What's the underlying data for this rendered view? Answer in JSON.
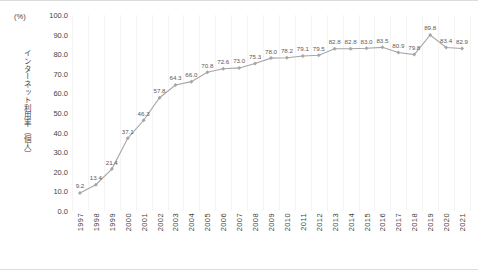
{
  "chart_data": {
    "type": "line",
    "title": "",
    "subtitle": "",
    "unit_label": "(%)",
    "xlabel": "",
    "ylabel": "インターネット利用率（個人）",
    "ylim": [
      0.0,
      100.0
    ],
    "ytick_labels": [
      "100.0",
      "90.0",
      "80.0",
      "70.0",
      "60.0",
      "50.0",
      "40.0",
      "30.0",
      "20.0",
      "10.0",
      "0.0"
    ],
    "ytick_values": [
      100.0,
      90.0,
      80.0,
      70.0,
      60.0,
      50.0,
      40.0,
      30.0,
      20.0,
      10.0,
      0.0
    ],
    "grid": "vertical-only",
    "legend": "none",
    "series_color": "#a6a6a6",
    "marker": "diamond",
    "categories": [
      "1997",
      "1998",
      "1999",
      "2000",
      "2001",
      "2002",
      "2003",
      "2004",
      "2005",
      "2006",
      "2007",
      "2008",
      "2009",
      "2010",
      "2011",
      "2012",
      "2013",
      "2014",
      "2015",
      "2016",
      "2017",
      "2018",
      "2019",
      "2020",
      "2021"
    ],
    "values": [
      9.2,
      13.4,
      21.4,
      37.1,
      46.3,
      57.8,
      64.3,
      66.0,
      70.8,
      72.6,
      73.0,
      75.3,
      78.0,
      78.2,
      79.1,
      79.5,
      82.8,
      82.8,
      83.0,
      83.5,
      80.9,
      79.8,
      89.8,
      83.4,
      82.9
    ],
    "data_labels": [
      "9.2",
      "13.4",
      "21.4",
      "37.1",
      "46.3",
      "57.8",
      "64.3",
      "66.0",
      "70.8",
      "72.6",
      "73.0",
      "75.3",
      "78.0",
      "78.2",
      "79.1",
      "79.5",
      "82.8",
      "82.8",
      "83.0",
      "83.5",
      "80.9",
      "79.8",
      "89.8",
      "83.4",
      "82.9"
    ]
  }
}
